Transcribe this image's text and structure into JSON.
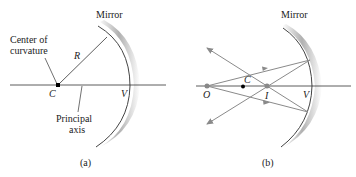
{
  "panel_a": {
    "mirror_label": "Mirror",
    "center_label_line1": "Center of",
    "center_label_line2": "curvature",
    "radius_label": "R",
    "center_point_label": "C",
    "vertex_label": "V",
    "axis_label_line1": "Principal",
    "axis_label_line2": "axis",
    "caption": "(a)"
  },
  "panel_b": {
    "mirror_label": "Mirror",
    "object_label": "O",
    "center_point_label": "C",
    "image_label": "I",
    "vertex_label": "V",
    "caption": "(b)"
  },
  "colors": {
    "line": "#333333",
    "ray": "#8a8a8a",
    "mirror_shade": "#b0b0b0"
  }
}
